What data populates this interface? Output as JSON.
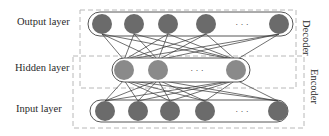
{
  "labels": {
    "output_layer": "Output layer",
    "hidden_layer": "Hidden layer",
    "input_layer": "Input layer",
    "decoder": "Decoder",
    "encoder": "Encoder",
    "ellipsis": "· · ·"
  },
  "colors": {
    "node_fill": "#6b6b6b",
    "hidden_node_fill": "#8a8a8a",
    "edge": "#333333",
    "dashed_box": "#b5b5b5",
    "pill_outline": "#444444"
  },
  "layers": {
    "output": {
      "node_count_visible": 5,
      "has_ellipsis": true
    },
    "hidden": {
      "node_count_visible": 3,
      "has_ellipsis": true
    },
    "input": {
      "node_count_visible": 5,
      "has_ellipsis": true
    }
  },
  "groups": [
    {
      "name": "Decoder",
      "spans": [
        "Hidden layer",
        "Output layer"
      ]
    },
    {
      "name": "Encoder",
      "spans": [
        "Input layer",
        "Hidden layer"
      ]
    }
  ]
}
